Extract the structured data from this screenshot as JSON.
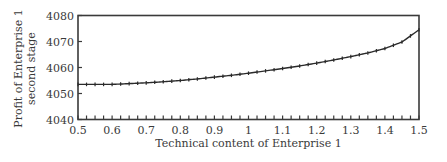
{
  "chart_data": {
    "type": "line",
    "title": "",
    "xlabel": "Technical content of Enterprise 1",
    "ylabel": [
      "Profit of Enterprise 1",
      "second stage"
    ],
    "xlim": [
      0.5,
      1.5
    ],
    "ylim": [
      4040,
      4080
    ],
    "xticks": [
      0.5,
      0.6,
      0.7,
      0.8,
      0.9,
      1,
      1.1,
      1.2,
      1.3,
      1.4,
      1.5
    ],
    "xtick_labels": [
      "0.5",
      "0.6",
      "0.7",
      "0.8",
      "0.9",
      "1",
      "1.1",
      "1.2",
      "1.3",
      "1.4",
      "1.5"
    ],
    "yticks": [
      4040,
      4050,
      4060,
      4070,
      4080
    ],
    "ytick_labels": [
      "4040",
      "4050",
      "4060",
      "4070",
      "4080"
    ],
    "grid": false,
    "legend": null,
    "series": [
      {
        "name": "Profit of Enterprise 1 second stage",
        "marker": "tick",
        "x": [
          0.5,
          0.55,
          0.6,
          0.65,
          0.7,
          0.75,
          0.8,
          0.85,
          0.9,
          0.95,
          1.0,
          1.05,
          1.1,
          1.15,
          1.2,
          1.25,
          1.3,
          1.35,
          1.4,
          1.45,
          1.5
        ],
        "values": [
          4053.5,
          4053.5,
          4053.5,
          4053.8,
          4054.1,
          4054.5,
          4055.0,
          4055.6,
          4056.3,
          4057.0,
          4057.8,
          4058.7,
          4059.6,
          4060.6,
          4061.7,
          4062.9,
          4064.2,
          4065.6,
          4067.3,
          4069.8,
          4074.5
        ]
      }
    ],
    "minor_xtick_step": 0.025
  },
  "figure": {
    "x_axis_label": "Technical content of Enterprise 1",
    "y_axis_label_line1": "Profit of Enterprise 1",
    "y_axis_label_line2": "second stage"
  }
}
